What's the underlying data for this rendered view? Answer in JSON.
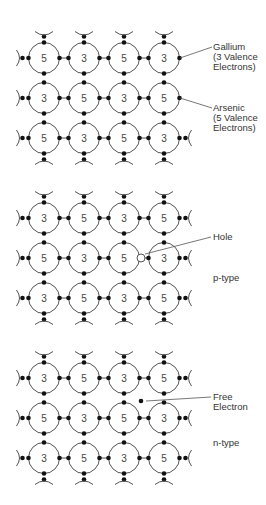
{
  "colors": {
    "line": "#555555",
    "dot": "#111111",
    "text": "#333333",
    "number": "#444444"
  },
  "layout": {
    "cols_x": [
      44,
      84,
      124,
      164
    ],
    "radius": 15.5,
    "row_gap": 40
  },
  "panels": [
    {
      "name": "intrinsic",
      "rows_y": [
        58,
        98,
        138
      ],
      "grid": [
        [
          "5",
          "3",
          "5",
          "3"
        ],
        [
          "3",
          "5",
          "3",
          "5"
        ],
        [
          "5",
          "3",
          "5",
          "3"
        ]
      ],
      "labels": [
        {
          "text": "Gallium\n(3 Valence\nElectrons)",
          "x": 213,
          "y": 42,
          "arrow_from": [
            212,
            47
          ],
          "arrow_to": [
            180,
            58
          ]
        },
        {
          "text": "Arsenic\n(5 Valence\nElectrons)",
          "x": 213,
          "y": 103,
          "arrow_from": [
            212,
            108
          ],
          "arrow_to": [
            180,
            98
          ]
        }
      ]
    },
    {
      "name": "p-type",
      "rows_y": [
        218,
        258,
        298
      ],
      "grid": [
        [
          "3",
          "5",
          "3",
          "5"
        ],
        [
          "5",
          "3",
          "5",
          "3"
        ],
        [
          "3",
          "5",
          "3",
          "5"
        ]
      ],
      "hole": {
        "x": 141,
        "y": 258
      },
      "labels": [
        {
          "text": "Hole",
          "x": 213,
          "y": 232,
          "arrow_from": [
            211,
            237
          ],
          "arrow_to": [
            145,
            254
          ]
        },
        {
          "text": "p-type",
          "x": 213,
          "y": 273
        }
      ]
    },
    {
      "name": "n-type",
      "rows_y": [
        378,
        418,
        458
      ],
      "grid": [
        [
          "3",
          "5",
          "3",
          "5"
        ],
        [
          "5",
          "3",
          "5",
          "3"
        ],
        [
          "3",
          "5",
          "3",
          "5"
        ]
      ],
      "free_electron": {
        "x": 141,
        "y": 401
      },
      "labels": [
        {
          "text": "Free\nElectron",
          "x": 213,
          "y": 392,
          "arrow_from": [
            211,
            397
          ],
          "arrow_to": [
            146,
            401
          ]
        },
        {
          "text": "n-type",
          "x": 213,
          "y": 438
        }
      ]
    }
  ]
}
